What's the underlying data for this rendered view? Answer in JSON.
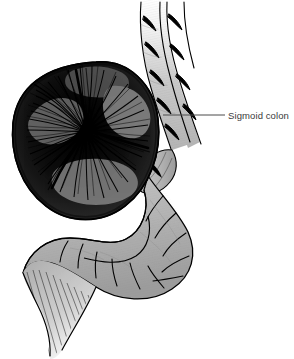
{
  "figure": {
    "background_color": "#ffffff",
    "width": 294,
    "height": 359
  },
  "labels": [
    {
      "id": "sigmoid-colon",
      "text": "Sigmoid colon",
      "text_color": "#3a3a3a",
      "leader_line": {
        "from_x": 163,
        "from_y": 115,
        "to_x": 225,
        "to_y": 115,
        "color": "#4a4a4a"
      }
    }
  ],
  "anatomy": {
    "structures": [
      {
        "name": "distended-bowel-loop",
        "description": "Massively dilated dark cross-hatched bowel loop",
        "fill_color": "#1a1a1a",
        "outline_color": "#000000"
      },
      {
        "name": "upper-colon-segments",
        "description": "Two parallel haustrated colon tubes ascending to top edge",
        "fill_color": "#b6b6b6",
        "outline_color": "#000000"
      },
      {
        "name": "lower-colon-loop",
        "description": "Haustrated sigmoid loop curving along the bottom",
        "fill_color": "#b6b6b6",
        "outline_color": "#000000"
      },
      {
        "name": "tapering-twisted-segment",
        "description": "Narrowed twisted segment tapering to lower left with fine striations",
        "fill_color": "#b0b0b0",
        "outline_color": "#000000"
      }
    ],
    "palette": {
      "paper": "#ffffff",
      "mid_gray": "#b6b6b6",
      "light_gray": "#d8d8d8",
      "dark_gray": "#6e6e6e",
      "ink": "#000000",
      "label_ink": "#3a3a3a"
    }
  }
}
